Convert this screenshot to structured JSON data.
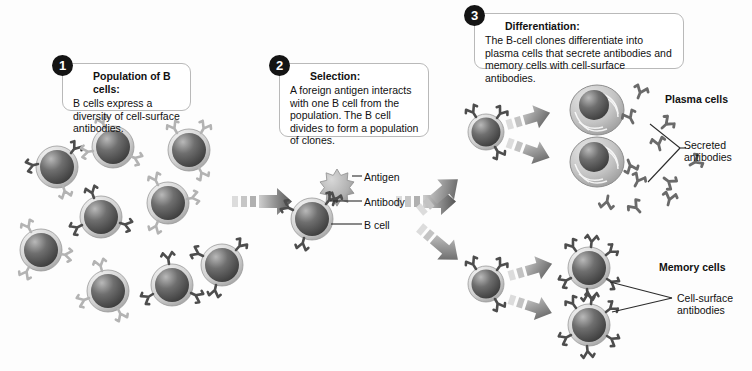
{
  "figure": {
    "background_color": "#fdfdfd"
  },
  "steps": [
    {
      "number": "1",
      "title": "Population of B cells:",
      "body": "B cells express a diversity of cell-surface antibodies."
    },
    {
      "number": "2",
      "title": "Selection:",
      "body": "A foreign antigen interacts with one B cell from the population. The B cell divides to form a population of clones."
    },
    {
      "number": "3",
      "title": "Differentiation:",
      "body": "The B-cell clones differentiate into plasma cells that secrete antibodies and memory cells with cell-surface antibodies."
    }
  ],
  "labels": {
    "antigen": "Antigen",
    "antibody": "Antibody",
    "b_cell": "B cell",
    "plasma_cells": "Plasma cells",
    "secreted_antibodies": "Secreted antibodies",
    "memory_cells": "Memory cells",
    "cell_surface_antibodies": "Cell-surface antibodies"
  },
  "colors": {
    "cell_dark": "#4a4a4a",
    "cell_light": "#cfcfcf",
    "cell_rim": "#e4e4e4",
    "antibody_dark": "#4d4d4d",
    "antibody_light": "#b5b5b5",
    "arrow_gray": "#7b7b7b",
    "text": "#111111",
    "box_border": "#b9b9b9",
    "badge": "#141414"
  },
  "cells": {
    "population_b_cells": 9,
    "clone_b_cells": 2,
    "plasma_cells": 2,
    "memory_cells": 2,
    "antigen_count": 1,
    "secreted_antibody_count": 11
  }
}
